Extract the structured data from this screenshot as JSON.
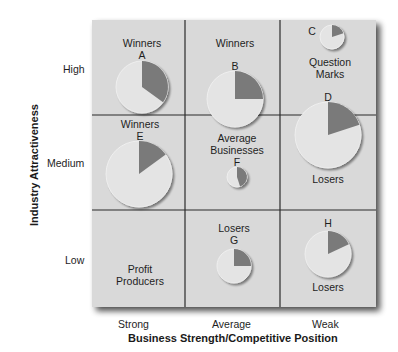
{
  "chart_data": {
    "type": "matrix-pie",
    "title": "",
    "xlabel": "Business Strength/Competitive Position",
    "ylabel": "Industry Attractiveness",
    "x_categories": [
      "Strong",
      "Average",
      "Weak"
    ],
    "y_categories": [
      "High",
      "Medium",
      "Low"
    ],
    "cells": [
      {
        "row": "High",
        "col": "Strong",
        "label": "Winners"
      },
      {
        "row": "High",
        "col": "Average",
        "label": "Winners"
      },
      {
        "row": "High",
        "col": "Weak",
        "label": "Question Marks"
      },
      {
        "row": "Medium",
        "col": "Strong",
        "label": "Winners"
      },
      {
        "row": "Medium",
        "col": "Average",
        "label": "Average Businesses"
      },
      {
        "row": "Medium",
        "col": "Weak",
        "label": "Losers"
      },
      {
        "row": "Low",
        "col": "Strong",
        "label": "Profit Producers"
      },
      {
        "row": "Low",
        "col": "Average",
        "label": "Losers"
      },
      {
        "row": "Low",
        "col": "Weak",
        "label": "Losers"
      }
    ],
    "businesses": [
      {
        "id": "A",
        "row": "High",
        "col": "Strong",
        "relative_size": 26,
        "share_pct": 35
      },
      {
        "id": "B",
        "row": "High",
        "col": "Average",
        "relative_size": 28,
        "share_pct": 25
      },
      {
        "id": "C",
        "row": "High",
        "col": "Weak",
        "relative_size": 12,
        "share_pct": 20
      },
      {
        "id": "D",
        "row": "Medium",
        "col": "Weak",
        "relative_size": 33,
        "share_pct": 20
      },
      {
        "id": "E",
        "row": "Medium",
        "col": "Strong",
        "relative_size": 33,
        "share_pct": 15
      },
      {
        "id": "F",
        "row": "Medium",
        "col": "Average",
        "relative_size": 10,
        "share_pct": 45
      },
      {
        "id": "G",
        "row": "Low",
        "col": "Average",
        "relative_size": 17,
        "share_pct": 25
      },
      {
        "id": "H",
        "row": "Low",
        "col": "Weak",
        "relative_size": 23,
        "share_pct": 18
      }
    ],
    "colors": {
      "cell_fill": "#d9d9d9",
      "pie_base": "#e4e4e4",
      "pie_slice": "#7a7a7a",
      "grid_line": "#2a2a2a"
    }
  },
  "labels": {
    "cell_winners_a": "Winners",
    "id_a": "A",
    "cell_winners_b": "Winners",
    "id_b": "B",
    "id_c": "C",
    "cell_question_1": "Question",
    "cell_question_2": "Marks",
    "id_d": "D",
    "cell_winners_e": "Winners",
    "id_e": "E",
    "cell_average_1": "Average",
    "cell_average_2": "Businesses",
    "id_f": "F",
    "cell_losers_d": "Losers",
    "cell_losers_g": "Losers",
    "id_g": "G",
    "id_h": "H",
    "cell_losers_h": "Losers",
    "cell_profit_1": "Profit",
    "cell_profit_2": "Producers",
    "y_high": "High",
    "y_medium": "Medium",
    "y_low": "Low",
    "x_strong": "Strong",
    "x_average": "Average",
    "x_weak": "Weak",
    "y_title": "Industry Attractiveness",
    "x_title": "Business Strength/Competitive Position"
  }
}
